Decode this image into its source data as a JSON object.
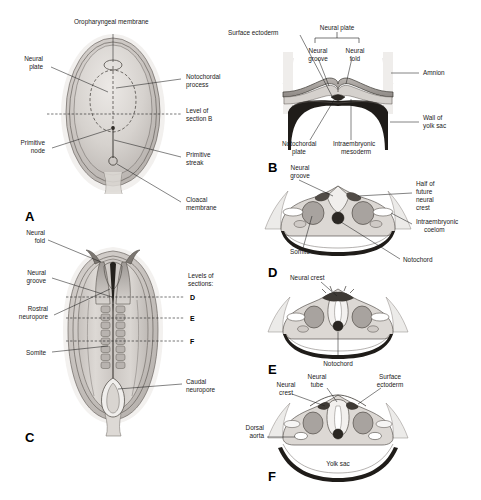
{
  "figure": {
    "background": "#ffffff",
    "width": 481,
    "height": 500,
    "ink": "#1d1d1d"
  },
  "panels": {
    "a": {
      "letter": "A",
      "labels": {
        "oropharyngeal_membrane": "Oropharyngeal membrane",
        "neural_plate_l1": "Neural",
        "neural_plate_l2": "plate",
        "primitive_node_l1": "Primitive",
        "primitive_node_l2": "node",
        "notochordal_process_l1": "Notochordal",
        "notochordal_process_l2": "process",
        "level_section_b_l1": "Level of",
        "level_section_b_l2": "section B",
        "primitive_streak_l1": "Primitive",
        "primitive_streak_l2": "streak",
        "cloacal_membrane_l1": "Cloacal",
        "cloacal_membrane_l2": "membrane"
      }
    },
    "b": {
      "letter": "B",
      "labels": {
        "surface_ectoderm_l1": "Surface ectoderm",
        "neural_plate": "Neural plate",
        "neural_groove_l1": "Neural",
        "neural_groove_l2": "groove",
        "neural_fold_l1": "Neural",
        "neural_fold_l2": "fold",
        "amnion": "Amnion",
        "wall_yolk_sac_l1": "Wall of",
        "wall_yolk_sac_l2": "yolk sac",
        "notochordal_plate_l1": "Notochordal",
        "notochordal_plate_l2": "plate",
        "intraembryonic_mesoderm_l1": "Intraembryonic",
        "intraembryonic_mesoderm_l2": "mesoderm"
      }
    },
    "c": {
      "letter": "C",
      "labels": {
        "neural_fold_l1": "Neural",
        "neural_fold_l2": "fold",
        "neural_groove_l1": "Neural",
        "neural_groove_l2": "groove",
        "rostral_neuropore_l1": "Rostral",
        "rostral_neuropore_l2": "neuropore",
        "somite": "Somite",
        "levels_l1": "Levels of",
        "levels_l2": "sections:",
        "level_d": "D",
        "level_e": "E",
        "level_f": "F",
        "caudal_neuropore_l1": "Caudal",
        "caudal_neuropore_l2": "neuropore"
      }
    },
    "d": {
      "letter": "D",
      "labels": {
        "neural_groove_l1": "Neural",
        "neural_groove_l2": "groove",
        "half_future_l1": "Half of",
        "half_future_l2": "future",
        "half_future_l3": "neural",
        "half_future_l4": "crest",
        "intraembryonic_coelom_l1": "Intraembryonic",
        "intraembryonic_coelom_l2": "coelom",
        "somite": "Somite",
        "notochord": "Notochord"
      }
    },
    "e": {
      "letter": "E",
      "labels": {
        "neural_crest": "Neural crest",
        "notochord": "Notochord"
      }
    },
    "f": {
      "letter": "F",
      "labels": {
        "neural_crest_l1": "Neural",
        "neural_crest_l2": "crest",
        "neural_tube_l1": "Neural",
        "neural_tube_l2": "tube",
        "surface_ectoderm_l1": "Surface",
        "surface_ectoderm_l2": "ectoderm",
        "dorsal_aorta_l1": "Dorsal",
        "dorsal_aorta_l2": "aorta",
        "yolk_sac": "Yolk sac"
      }
    }
  }
}
